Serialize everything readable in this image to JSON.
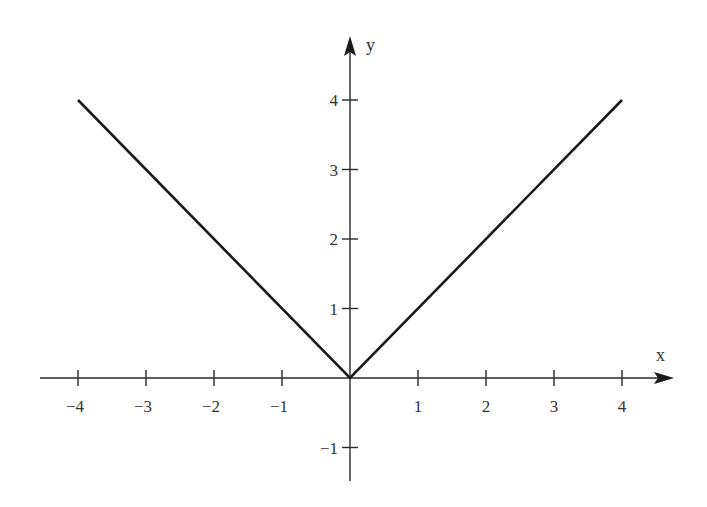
{
  "chart_data": {
    "type": "line",
    "title": "",
    "xlabel": "x",
    "ylabel": "y",
    "xlim": [
      -4.4,
      4.8
    ],
    "ylim": [
      -1.5,
      4.5
    ],
    "grid": false,
    "legend": "none",
    "x_ticks": [
      -4,
      -3,
      -2,
      -1,
      1,
      2,
      3,
      4
    ],
    "x_tick_labels": [
      "−4",
      "−3",
      "−2",
      "−1",
      "1",
      "2",
      "3",
      "4"
    ],
    "y_ticks": [
      -1,
      1,
      2,
      3,
      4
    ],
    "y_tick_labels": [
      "−1",
      "1",
      "2",
      "3",
      "4"
    ],
    "series": [
      {
        "name": "y = |x|",
        "x": [
          -4,
          0,
          4
        ],
        "y": [
          4,
          0,
          4
        ],
        "color": "#1a1a1a"
      }
    ]
  }
}
